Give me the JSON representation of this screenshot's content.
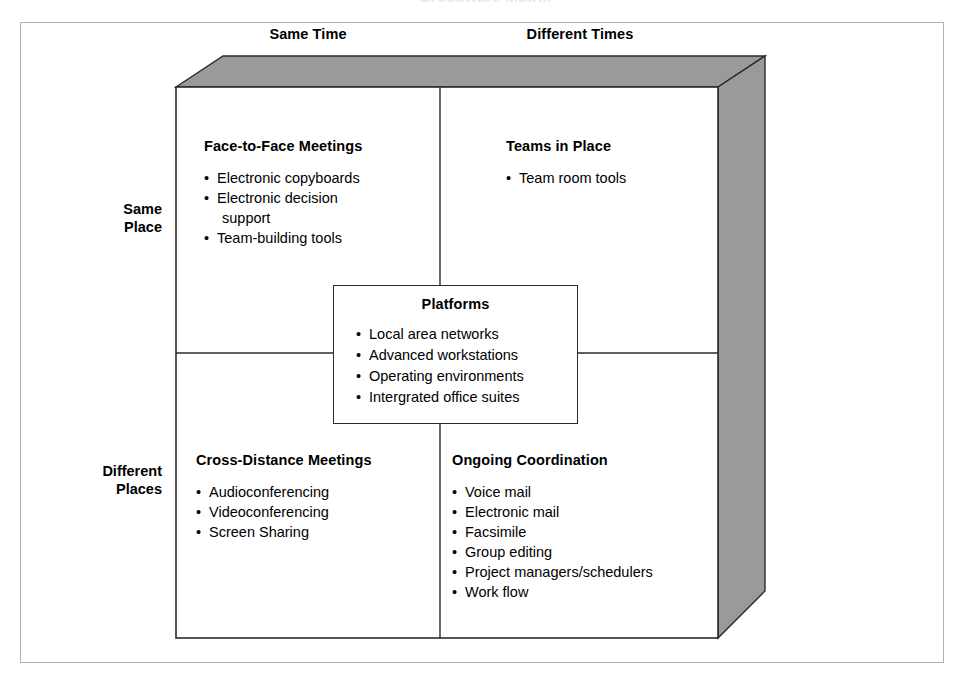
{
  "figure": {
    "cropped_title_remnant": "Groupware Matrix",
    "frame_color": "#b4b4b4",
    "box_line_color": "#2b2b2b",
    "extrusion_fill": "#9a9a9a",
    "background": "#ffffff"
  },
  "axes": {
    "columns": [
      {
        "label": "Same Time"
      },
      {
        "label": "Different Times"
      }
    ],
    "rows": [
      {
        "label_line1": "Same",
        "label_line2": "Place"
      },
      {
        "label_line1": "Different",
        "label_line2": "Places"
      }
    ]
  },
  "quadrants": [
    {
      "key": "face_to_face",
      "title": "Face-to-Face Meetings",
      "items": [
        {
          "text": "Electronic copyboards",
          "continuation": false
        },
        {
          "text": "Electronic decision",
          "continuation": false
        },
        {
          "text": "support",
          "continuation": true
        },
        {
          "text": "Team-building tools",
          "continuation": false
        }
      ]
    },
    {
      "key": "teams_in_place",
      "title": "Teams in Place",
      "items": [
        {
          "text": "Team room tools",
          "continuation": false
        }
      ]
    },
    {
      "key": "cross_distance",
      "title": "Cross-Distance Meetings",
      "items": [
        {
          "text": "Audioconferencing",
          "continuation": false
        },
        {
          "text": "Videoconferencing",
          "continuation": false
        },
        {
          "text": "Screen Sharing",
          "continuation": false
        }
      ]
    },
    {
      "key": "ongoing_coordination",
      "title": "Ongoing Coordination",
      "items": [
        {
          "text": "Voice mail",
          "continuation": false
        },
        {
          "text": "Electronic mail",
          "continuation": false
        },
        {
          "text": "Facsimile",
          "continuation": false
        },
        {
          "text": "Group editing",
          "continuation": false
        },
        {
          "text": "Project managers/schedulers",
          "continuation": false
        },
        {
          "text": "Work flow",
          "continuation": false
        }
      ]
    }
  ],
  "center_box": {
    "title": "Platforms",
    "items": [
      "Local area networks",
      "Advanced workstations",
      "Operating environments",
      "Intergrated office suites"
    ]
  }
}
